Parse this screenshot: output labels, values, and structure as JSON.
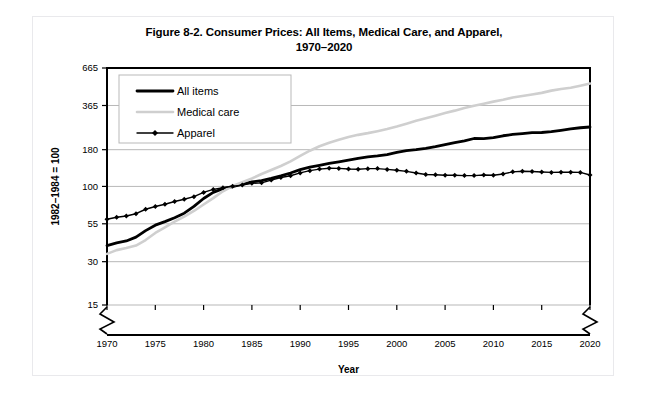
{
  "figure": {
    "title_line1": "Figure 8-2. Consumer Prices: All Items, Medical Care, and Apparel,",
    "title_line2": "1970–2020"
  },
  "chart_data": {
    "type": "line",
    "title": "Figure 8-2. Consumer Prices: All Items, Medical Care, and Apparel, 1970–2020",
    "xlabel": "Year",
    "ylabel": "1982–1984 = 100",
    "yscale": "log",
    "ylim": [
      15,
      665
    ],
    "xlim": [
      1970,
      2020
    ],
    "grid": true,
    "axis_break": true,
    "legend_position": "top-left",
    "ytick_labels": [
      "15",
      "30",
      "55",
      "100",
      "180",
      "365",
      "665"
    ],
    "yticks": [
      15,
      30,
      55,
      100,
      180,
      365,
      665
    ],
    "xtick_labels": [
      "1970",
      "1975",
      "1980",
      "1985",
      "1990",
      "1995",
      "2000",
      "2005",
      "2010",
      "2015",
      "2020"
    ],
    "xticks": [
      1970,
      1975,
      1980,
      1985,
      1990,
      1995,
      2000,
      2005,
      2010,
      2015,
      2020
    ],
    "x": [
      1970,
      1971,
      1972,
      1973,
      1974,
      1975,
      1976,
      1977,
      1978,
      1979,
      1980,
      1981,
      1982,
      1983,
      1984,
      1985,
      1986,
      1987,
      1988,
      1989,
      1990,
      1991,
      1992,
      1993,
      1994,
      1995,
      1996,
      1997,
      1998,
      1999,
      2000,
      2001,
      2002,
      2003,
      2004,
      2005,
      2006,
      2007,
      2008,
      2009,
      2010,
      2011,
      2012,
      2013,
      2014,
      2015,
      2016,
      2017,
      2018,
      2019,
      2020
    ],
    "series": [
      {
        "name": "All items",
        "color": "#000000",
        "style": "thick-solid",
        "values": [
          38.8,
          40.5,
          41.8,
          44.4,
          49.3,
          53.8,
          56.9,
          60.6,
          65.2,
          72.6,
          82.4,
          90.9,
          96.5,
          99.6,
          103.9,
          107.6,
          109.6,
          113.6,
          118.3,
          124.0,
          130.7,
          136.2,
          140.3,
          144.5,
          148.2,
          152.4,
          156.9,
          160.5,
          163.0,
          166.6,
          172.2,
          177.1,
          179.9,
          184.0,
          188.9,
          195.3,
          201.6,
          207.3,
          215.3,
          214.5,
          218.1,
          224.9,
          229.6,
          233.0,
          236.7,
          237.0,
          240.0,
          245.1,
          251.1,
          255.7,
          258.8
        ]
      },
      {
        "name": "Medical care",
        "color": "#cfcfcf",
        "style": "thin-solid-light",
        "values": [
          34.0,
          36.1,
          37.3,
          38.8,
          42.4,
          47.5,
          52.0,
          57.0,
          61.8,
          67.5,
          74.9,
          82.9,
          92.5,
          100.6,
          106.8,
          113.5,
          122.0,
          130.1,
          138.6,
          149.3,
          162.8,
          177.0,
          190.1,
          201.4,
          211.0,
          220.5,
          228.2,
          234.6,
          242.1,
          250.6,
          260.8,
          272.8,
          285.6,
          297.1,
          310.1,
          323.2,
          336.2,
          351.1,
          364.1,
          375.6,
          388.4,
          400.3,
          414.9,
          425.1,
          435.3,
          446.8,
          463.0,
          475.3,
          484.6,
          500.8,
          519.0
        ]
      },
      {
        "name": "Apparel",
        "color": "#000000",
        "style": "thin-solid-diamond",
        "values": [
          59.2,
          61.1,
          62.3,
          64.6,
          69.4,
          72.5,
          75.2,
          78.6,
          81.4,
          84.9,
          90.9,
          95.3,
          97.8,
          100.2,
          102.1,
          105.0,
          105.9,
          110.6,
          115.4,
          118.6,
          124.1,
          128.7,
          131.9,
          133.7,
          133.4,
          132.0,
          131.7,
          132.9,
          133.0,
          131.3,
          129.6,
          127.3,
          124.0,
          120.9,
          120.4,
          119.5,
          119.5,
          118.9,
          118.9,
          120.1,
          119.5,
          122.1,
          126.3,
          127.4,
          127.0,
          125.9,
          125.1,
          125.6,
          125.5,
          125.1,
          120.0
        ]
      }
    ]
  }
}
